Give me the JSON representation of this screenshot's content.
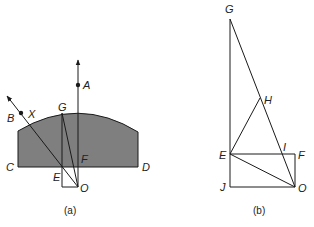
{
  "figure": {
    "panel_a": {
      "caption": "(a)",
      "shape_fill": "#7f7f7f",
      "labels": {
        "A": "A",
        "B": "B",
        "X": "X",
        "G": "G",
        "C": "C",
        "D": "D",
        "E": "E",
        "F": "F",
        "O": "O"
      }
    },
    "panel_b": {
      "caption": "(b)",
      "labels": {
        "G": "G",
        "H": "H",
        "E": "E",
        "I": "I",
        "F": "F",
        "J": "J",
        "O": "O"
      }
    },
    "line_color": "#1a1a1a"
  }
}
